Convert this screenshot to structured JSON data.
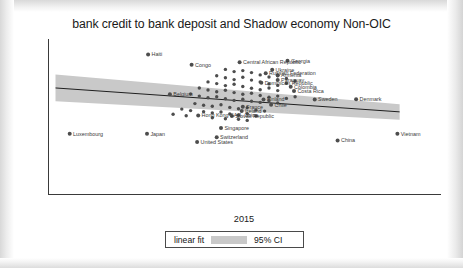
{
  "chart_data": {
    "type": "scatter",
    "title": "bank credit to bank deposit and Shadow economy Non-OIC",
    "xlabel": "2015",
    "ylabel": "shadow economy",
    "xlim": [
      1.25,
      3.05
    ],
    "ylim": [
      0.78,
      1.85
    ],
    "xticks": [
      1.5,
      2,
      2.5,
      3
    ],
    "xticklabels": [
      "1.5",
      "2",
      "2.5",
      "3"
    ],
    "yticks": [
      0.8,
      1.0,
      1.2,
      1.4,
      1.6,
      1.8
    ],
    "yticklabels": [
      ".8",
      "1",
      "1.2",
      "1.4",
      "1.6",
      "1.8"
    ],
    "grid": false,
    "legend": {
      "position": "below-axis",
      "entries": [
        {
          "label": "linear fit",
          "type": "line"
        },
        {
          "label": "95% CI",
          "type": "band",
          "color": "#c9c9c9"
        }
      ]
    },
    "fit": {
      "type": "linear",
      "x": [
        1.28,
        2.86
      ],
      "y": [
        1.512,
        1.347
      ]
    },
    "ci_band": {
      "x": [
        1.28,
        2.86
      ],
      "upper": [
        1.605,
        1.4
      ],
      "lower": [
        1.42,
        1.292
      ]
    },
    "points": [
      {
        "label": "Haiti",
        "x": 1.705,
        "y": 1.742
      },
      {
        "label": "Congo",
        "x": 1.905,
        "y": 1.672
      },
      {
        "label": "Central African Republic",
        "x": 2.125,
        "y": 1.69
      },
      {
        "label": "Georgia",
        "x": 2.345,
        "y": 1.7
      },
      {
        "label": "Ukraine",
        "x": 2.275,
        "y": 1.638
      },
      {
        "label": "Armenia",
        "x": 2.3,
        "y": 1.6
      },
      {
        "label": "Russian Federation",
        "x": 2.245,
        "y": 1.614
      },
      {
        "label": "Paraguay",
        "x": 2.3,
        "y": 1.568
      },
      {
        "label": "Dominican Republic",
        "x": 2.225,
        "y": 1.548
      },
      {
        "label": "Colombia",
        "x": 2.36,
        "y": 1.52
      },
      {
        "label": "Costa Rica",
        "x": 2.375,
        "y": 1.49
      },
      {
        "label": "Belgium",
        "x": 1.805,
        "y": 1.468
      },
      {
        "label": "Sweden",
        "x": 2.47,
        "y": 1.432
      },
      {
        "label": "Denmark",
        "x": 2.66,
        "y": 1.434
      },
      {
        "label": "Finland",
        "x": 2.235,
        "y": 1.432
      },
      {
        "label": "Chile",
        "x": 2.27,
        "y": 1.396
      },
      {
        "label": "France",
        "x": 2.14,
        "y": 1.382
      },
      {
        "label": "Ireland",
        "x": 2.135,
        "y": 1.352
      },
      {
        "label": "Hong Kong SAR, China",
        "x": 1.935,
        "y": 1.322
      },
      {
        "label": "Slovak Republic",
        "x": 2.09,
        "y": 1.318
      },
      {
        "label": "Singapore",
        "x": 2.04,
        "y": 1.235
      },
      {
        "label": "Switzerland",
        "x": 2.02,
        "y": 1.172
      },
      {
        "label": "Luxembourg",
        "x": 1.345,
        "y": 1.196
      },
      {
        "label": "Japan",
        "x": 1.7,
        "y": 1.196
      },
      {
        "label": "United States",
        "x": 1.93,
        "y": 1.14
      },
      {
        "label": "China",
        "x": 2.575,
        "y": 1.15
      },
      {
        "label": "Vietnam",
        "x": 2.85,
        "y": 1.196
      }
    ],
    "cluster_points": [
      {
        "x": 2.06,
        "y": 1.64
      },
      {
        "x": 2.1,
        "y": 1.625
      },
      {
        "x": 2.14,
        "y": 1.632
      },
      {
        "x": 2.18,
        "y": 1.618
      },
      {
        "x": 2.22,
        "y": 1.602
      },
      {
        "x": 2.26,
        "y": 1.588
      },
      {
        "x": 2.3,
        "y": 1.596
      },
      {
        "x": 2.34,
        "y": 1.578
      },
      {
        "x": 2.38,
        "y": 1.56
      },
      {
        "x": 2.02,
        "y": 1.596
      },
      {
        "x": 2.06,
        "y": 1.582
      },
      {
        "x": 2.1,
        "y": 1.57
      },
      {
        "x": 2.14,
        "y": 1.586
      },
      {
        "x": 2.18,
        "y": 1.566
      },
      {
        "x": 2.22,
        "y": 1.554
      },
      {
        "x": 2.26,
        "y": 1.54
      },
      {
        "x": 2.3,
        "y": 1.53
      },
      {
        "x": 2.34,
        "y": 1.544
      },
      {
        "x": 1.98,
        "y": 1.554
      },
      {
        "x": 2.02,
        "y": 1.542
      },
      {
        "x": 2.06,
        "y": 1.528
      },
      {
        "x": 2.1,
        "y": 1.538
      },
      {
        "x": 2.14,
        "y": 1.522
      },
      {
        "x": 2.18,
        "y": 1.51
      },
      {
        "x": 2.22,
        "y": 1.5
      },
      {
        "x": 2.26,
        "y": 1.512
      },
      {
        "x": 2.3,
        "y": 1.494
      },
      {
        "x": 1.94,
        "y": 1.512
      },
      {
        "x": 1.98,
        "y": 1.498
      },
      {
        "x": 2.02,
        "y": 1.486
      },
      {
        "x": 2.06,
        "y": 1.496
      },
      {
        "x": 2.1,
        "y": 1.48
      },
      {
        "x": 2.14,
        "y": 1.468
      },
      {
        "x": 2.18,
        "y": 1.476
      },
      {
        "x": 2.22,
        "y": 1.46
      },
      {
        "x": 2.26,
        "y": 1.448
      },
      {
        "x": 2.3,
        "y": 1.456
      },
      {
        "x": 2.34,
        "y": 1.44
      },
      {
        "x": 2.38,
        "y": 1.452
      },
      {
        "x": 1.9,
        "y": 1.47
      },
      {
        "x": 1.94,
        "y": 1.456
      },
      {
        "x": 1.98,
        "y": 1.444
      },
      {
        "x": 2.02,
        "y": 1.452
      },
      {
        "x": 2.06,
        "y": 1.438
      },
      {
        "x": 2.1,
        "y": 1.426
      },
      {
        "x": 2.14,
        "y": 1.434
      },
      {
        "x": 2.18,
        "y": 1.42
      },
      {
        "x": 2.22,
        "y": 1.412
      },
      {
        "x": 2.26,
        "y": 1.424
      },
      {
        "x": 2.3,
        "y": 1.408
      },
      {
        "x": 1.92,
        "y": 1.404
      },
      {
        "x": 1.96,
        "y": 1.392
      },
      {
        "x": 2.0,
        "y": 1.386
      },
      {
        "x": 2.04,
        "y": 1.396
      },
      {
        "x": 2.08,
        "y": 1.378
      },
      {
        "x": 2.12,
        "y": 1.368
      },
      {
        "x": 2.16,
        "y": 1.376
      },
      {
        "x": 2.2,
        "y": 1.36
      },
      {
        "x": 2.24,
        "y": 1.352
      },
      {
        "x": 1.86,
        "y": 1.366
      },
      {
        "x": 1.9,
        "y": 1.356
      },
      {
        "x": 1.96,
        "y": 1.348
      },
      {
        "x": 2.0,
        "y": 1.34
      },
      {
        "x": 2.04,
        "y": 1.346
      },
      {
        "x": 2.08,
        "y": 1.332
      },
      {
        "x": 2.12,
        "y": 1.324
      },
      {
        "x": 2.16,
        "y": 1.334
      },
      {
        "x": 2.2,
        "y": 1.318
      },
      {
        "x": 1.82,
        "y": 1.33
      },
      {
        "x": 1.88,
        "y": 1.32
      },
      {
        "x": 2.0,
        "y": 1.306
      },
      {
        "x": 2.06,
        "y": 1.3
      },
      {
        "x": 2.12,
        "y": 1.296
      },
      {
        "x": 2.16,
        "y": 1.288
      }
    ]
  }
}
